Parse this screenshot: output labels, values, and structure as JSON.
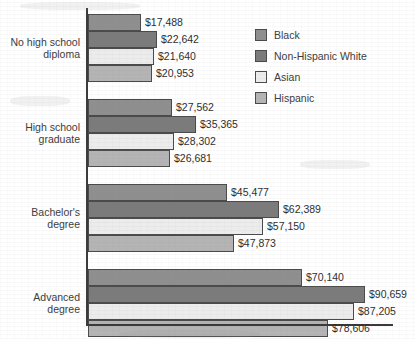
{
  "chart_data": {
    "type": "bar",
    "orientation": "horizontal",
    "title": "",
    "subtitle": "",
    "xlabel": "",
    "ylabel": "",
    "grid": false,
    "legend_position": "top-right",
    "xlim": [
      0,
      100000
    ],
    "categories": [
      "No high school diploma",
      "High school graduate",
      "Bachelor's degree",
      "Advanced degree"
    ],
    "category_lines": [
      [
        "No high school",
        "diploma"
      ],
      [
        "High school",
        "graduate"
      ],
      [
        "Bachelor's",
        "degree"
      ],
      [
        "Advanced",
        "degree"
      ]
    ],
    "series": [
      {
        "name": "Black",
        "color": "#8f8f8f",
        "values": [
          17488,
          27562,
          45477,
          70140
        ],
        "labels": [
          "$17,488",
          "$27,562",
          "$45,477",
          "$70,140"
        ]
      },
      {
        "name": "Non-Hispanic White",
        "color": "#7b7b7b",
        "values": [
          22642,
          35365,
          62389,
          90659
        ],
        "labels": [
          "$22,642",
          "$35,365",
          "$62,389",
          "$90,659"
        ]
      },
      {
        "name": "Asian",
        "color": "#ececec",
        "values": [
          21640,
          28302,
          57150,
          87205
        ],
        "labels": [
          "$21,640",
          "$28,302",
          "$57,150",
          "$87,205"
        ]
      },
      {
        "name": "Hispanic",
        "color": "#b4b4b4",
        "values": [
          20953,
          26681,
          47873,
          78606
        ],
        "labels": [
          "$20,953",
          "$26,681",
          "$47,873",
          "$78,606"
        ]
      }
    ]
  },
  "legend": {
    "items": [
      {
        "label": "Black"
      },
      {
        "label": "Non-Hispanic White"
      },
      {
        "label": "Asian"
      },
      {
        "label": "Hispanic"
      }
    ]
  },
  "axes": {
    "y_axis_visible": true,
    "x_axis_visible": true,
    "tick_labels": []
  }
}
